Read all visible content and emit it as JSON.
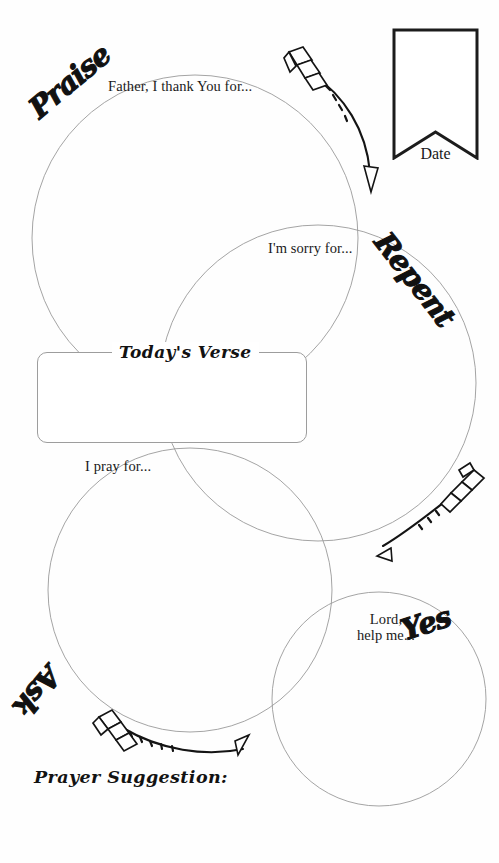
{
  "page": {
    "background_color": "#fefefe",
    "ink_color": "#111111",
    "circle_stroke_color": "#9a9a9a",
    "width": 499,
    "height": 863
  },
  "date_field": {
    "label": "Date",
    "shape": "ribbon-banner",
    "value": ""
  },
  "steps": [
    {
      "key": "praise",
      "heading": "Praise",
      "prompt": "Father, I thank You for...",
      "rotation_deg": -40,
      "circle": {
        "cx": 195,
        "cy": 238,
        "r": 163
      }
    },
    {
      "key": "repent",
      "heading": "Repent",
      "prompt": "I'm sorry for...",
      "rotation_deg": 52,
      "circle": {
        "cx": 318,
        "cy": 383,
        "r": 158
      }
    },
    {
      "key": "ask",
      "heading": "Ask",
      "prompt": "I pray for...",
      "rotation_deg": 130,
      "circle": {
        "cx": 190,
        "cy": 590,
        "r": 142
      }
    },
    {
      "key": "yes",
      "heading": "Yes",
      "prompt": "Lord,\nhelp me...",
      "prompt_line1": "Lord,",
      "prompt_line2": "help me...",
      "rotation_deg": -18,
      "circle": {
        "cx": 379,
        "cy": 699,
        "r": 107
      }
    }
  ],
  "verse": {
    "title": "Today's Verse",
    "value": "",
    "box": {
      "x": 37,
      "y": 352,
      "w": 270,
      "h": 91
    }
  },
  "suggestion": {
    "title": "Prayer Suggestion:",
    "value": ""
  },
  "arrows": [
    {
      "name": "arrow-praise-to-repent",
      "from": "praise",
      "to": "repent",
      "direction": "clockwise-down-right"
    },
    {
      "name": "arrow-repent-to-ask",
      "from": "repent",
      "to": "ask",
      "direction": "leftward"
    },
    {
      "name": "arrow-ask-to-yes",
      "from": "ask",
      "to": "yes",
      "direction": "rightward"
    }
  ]
}
